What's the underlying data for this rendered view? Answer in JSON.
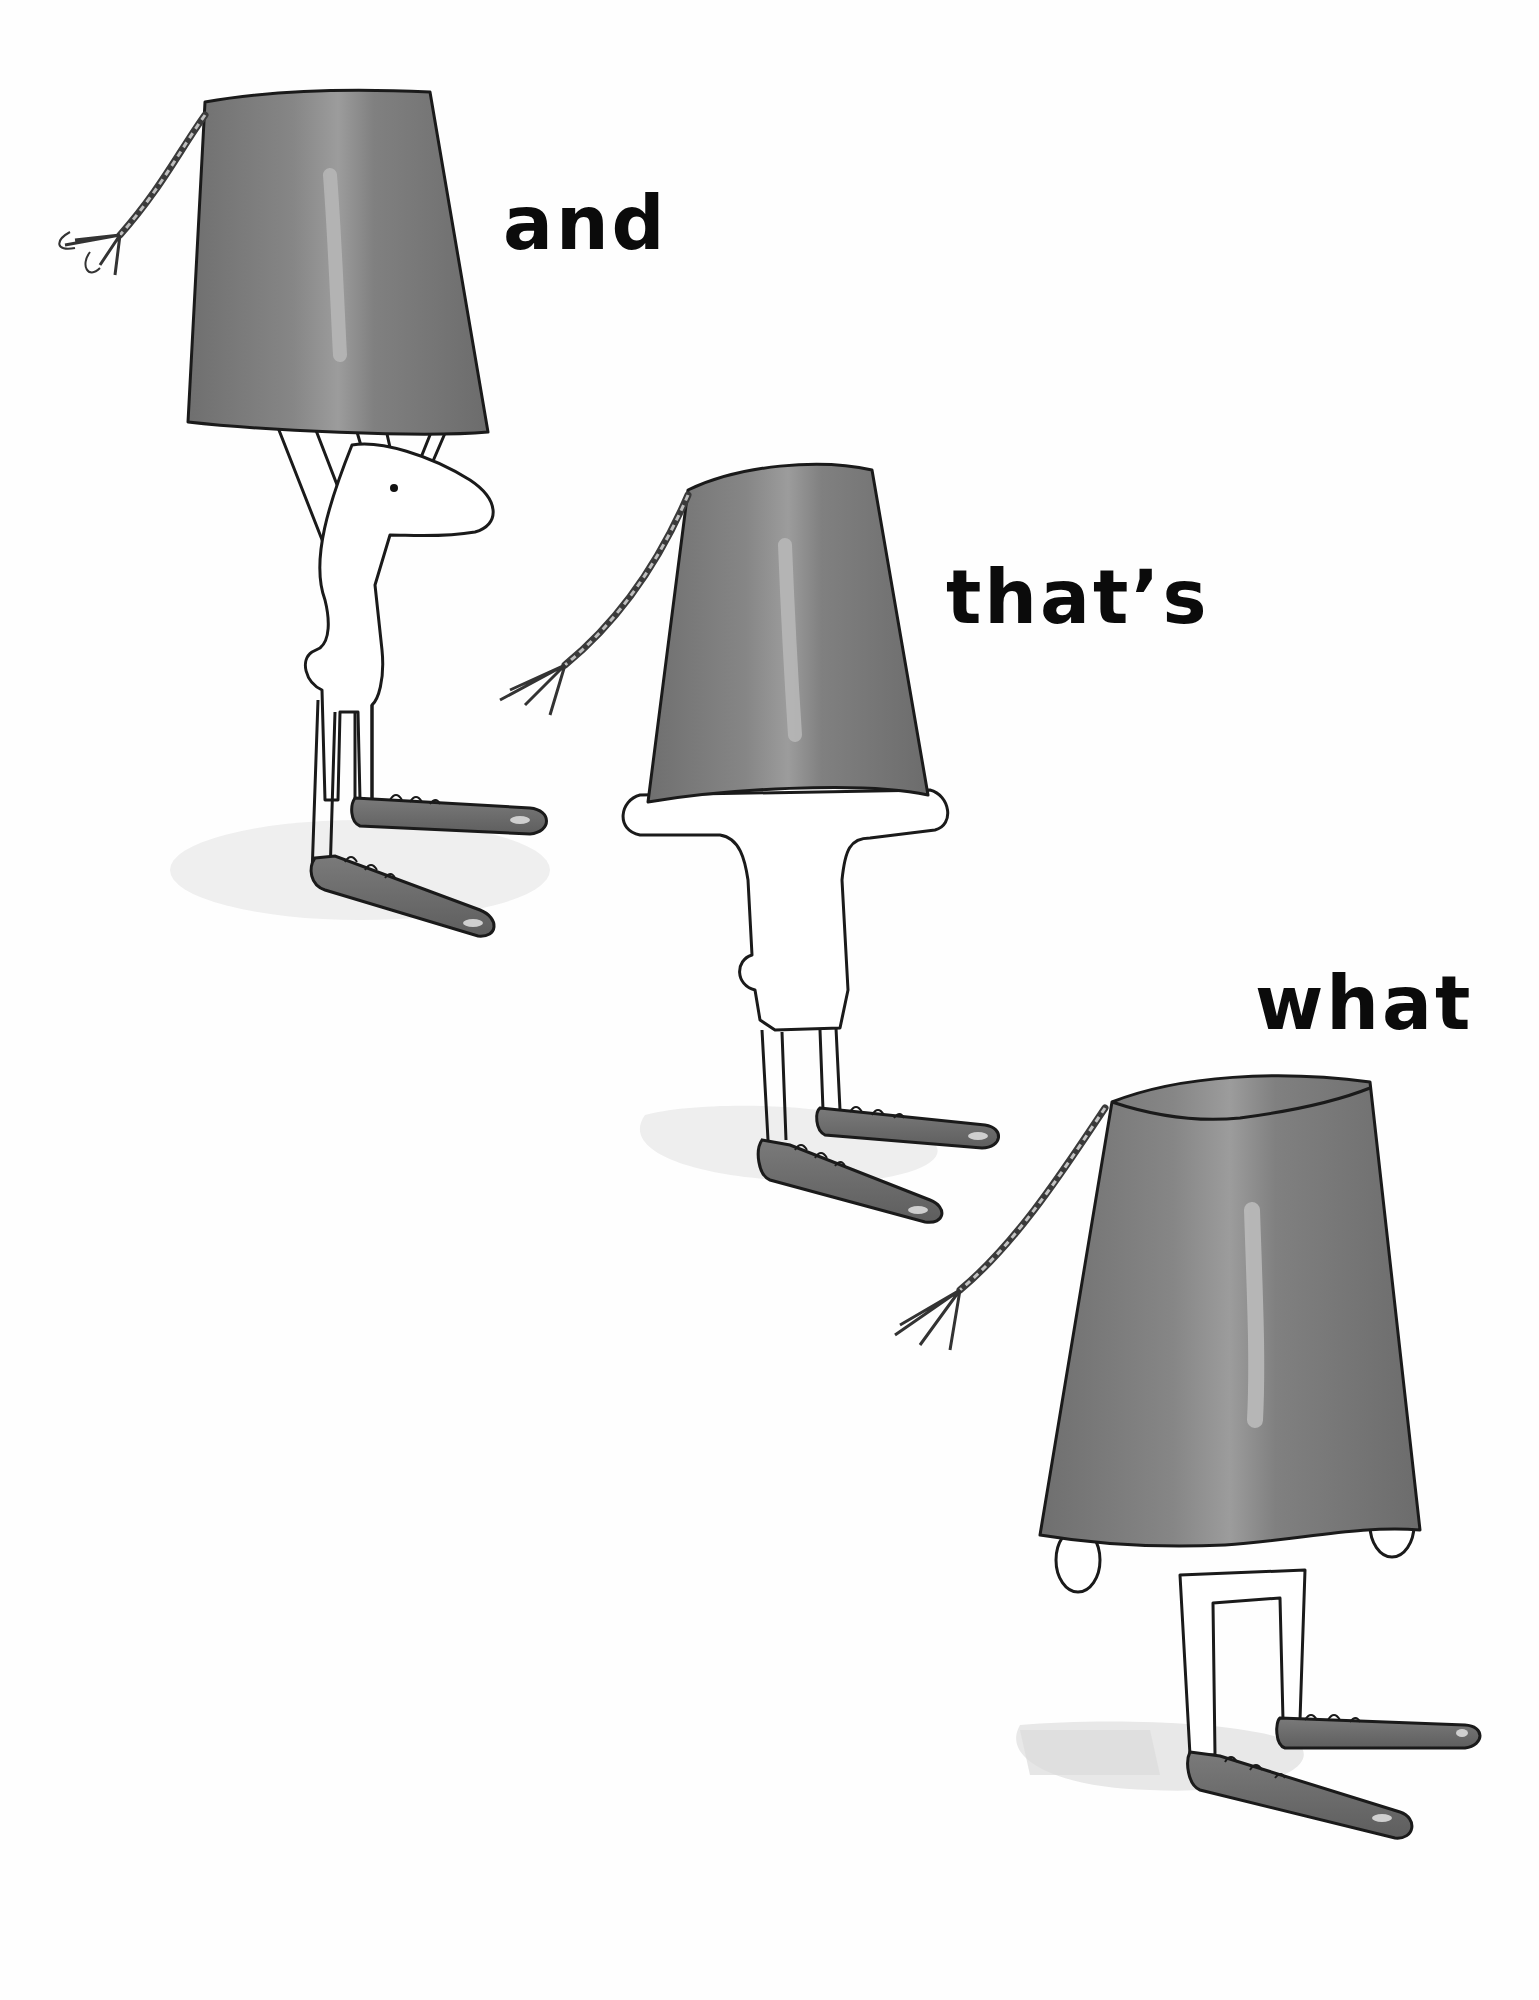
{
  "page": {
    "background": "#fefefe",
    "ink_color": "#1a1a1a",
    "bucket_color": "#7d7d7d",
    "shoe_color": "#6e6e6e",
    "shadow_color": "#e9e9e9"
  },
  "text": {
    "words": [
      {
        "label": "and"
      },
      {
        "label": "that’s"
      },
      {
        "label": "what"
      }
    ]
  },
  "illustration": {
    "figures": [
      {
        "name": "figure-1",
        "pose": "lifting bucket above head, face visible, long nose, dot eye",
        "icon": "bucket-head-figure"
      },
      {
        "name": "figure-2",
        "pose": "bucket lowered over head, hands on rim",
        "icon": "bucket-head-figure"
      },
      {
        "name": "figure-3",
        "pose": "bucket fully covering head and body, hands at sides",
        "icon": "bucket-head-figure"
      }
    ]
  }
}
